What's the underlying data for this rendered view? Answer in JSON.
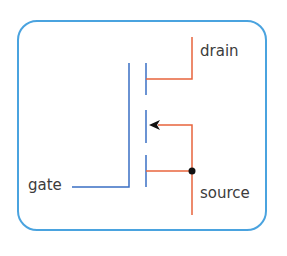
{
  "labels": {
    "drain": "drain",
    "gate": "gate",
    "source": "source"
  },
  "colors": {
    "frame": "#4aa3df",
    "gate_wire": "#3a6fc4",
    "channel_wire": "#e8643c",
    "junction": "#111111",
    "text": "#3c3c3c"
  }
}
